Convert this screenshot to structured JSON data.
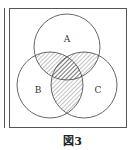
{
  "figure": {
    "caption": "図3",
    "sets": [
      {
        "label": "A",
        "cx": 67,
        "cy": 47,
        "r": 33
      },
      {
        "label": "B",
        "cx": 50,
        "cy": 85,
        "r": 33
      },
      {
        "label": "C",
        "cx": 84,
        "cy": 85,
        "r": 33
      }
    ],
    "shaded_regions": [
      "A∩B",
      "A∩C",
      "B∩C"
    ],
    "line_color": "#555555",
    "hatch_color": "#666666"
  }
}
